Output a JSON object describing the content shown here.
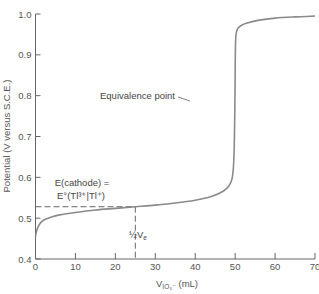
{
  "chart_data": {
    "type": "line",
    "title": "",
    "xlabel": "V",
    "xlabel_subscript": "IO3−",
    "xlabel_unit": "(mL)",
    "ylabel": "Potential (V versus S.C.E.)",
    "xlim": [
      0,
      70
    ],
    "ylim": [
      0.4,
      1.0
    ],
    "xticks": [
      0,
      10,
      20,
      30,
      40,
      50,
      60,
      70
    ],
    "yticks": [
      0.4,
      0.5,
      0.6,
      0.7,
      0.8,
      0.9,
      1.0
    ],
    "xtick_labels": [
      "0",
      "10",
      "20",
      "30",
      "40",
      "50",
      "60",
      "70"
    ],
    "ytick_labels": [
      "0.4",
      "0.5",
      "0.6",
      "0.7",
      "0.8",
      "0.9",
      "1.0"
    ],
    "grid": false,
    "legend": null,
    "series": [
      {
        "name": "Titration curve",
        "x": [
          0,
          0.3,
          1,
          2,
          4,
          6,
          10,
          15,
          20,
          25,
          30,
          35,
          40,
          44,
          47,
          48.5,
          49.3,
          49.7,
          49.9,
          50,
          50.1,
          50.3,
          50.7,
          51.5,
          53,
          56,
          60,
          65,
          70
        ],
        "y": [
          0.455,
          0.47,
          0.485,
          0.495,
          0.503,
          0.508,
          0.514,
          0.52,
          0.524,
          0.528,
          0.532,
          0.537,
          0.544,
          0.553,
          0.566,
          0.58,
          0.6,
          0.65,
          0.75,
          0.85,
          0.93,
          0.955,
          0.965,
          0.972,
          0.978,
          0.985,
          0.99,
          0.993,
          0.995
        ]
      }
    ],
    "annotations": [
      {
        "text": "Equivalence point",
        "x": 50,
        "y": 0.78,
        "type": "leader-line"
      },
      {
        "text_line1": "E(cathode) =",
        "text_line2": "E°(Tl³⁺|Tl⁺)",
        "type": "dashed-horizontal",
        "y": 0.528,
        "x_end": 25
      },
      {
        "text": "½Vₑ",
        "type": "dashed-vertical",
        "x": 25
      }
    ]
  },
  "labels": {
    "equivalence": "Equivalence point",
    "ecathode_line1": "E(cathode) =",
    "ecathode_line2": "E°(Tl³⁺|Tl⁺)",
    "half_ve": "½V",
    "half_ve_sub": "e",
    "ylabel": "Potential (V versus S.C.E.)",
    "xlabel_main": "V",
    "xlabel_sub": "IO₃⁻",
    "xlabel_unit": " (mL)"
  }
}
